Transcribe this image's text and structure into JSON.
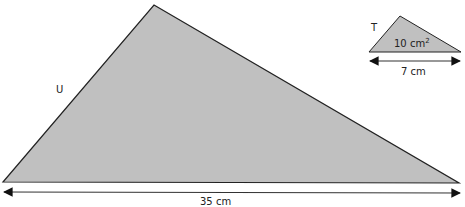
{
  "diagram": {
    "fill_color": "#c0c0c0",
    "stroke_color": "#222222",
    "shapes": [
      {
        "id": "U",
        "label": "U",
        "base_label": "35 cm",
        "vertices": [
          [
            3,
            182
          ],
          [
            154,
            5
          ],
          [
            459,
            183
          ]
        ]
      },
      {
        "id": "T",
        "label": "T",
        "area_value": "10 cm",
        "area_exponent": "2",
        "base_label": "7 cm",
        "vertices": [
          [
            369,
            52
          ],
          [
            400,
            16
          ],
          [
            461,
            52
          ]
        ]
      }
    ]
  }
}
